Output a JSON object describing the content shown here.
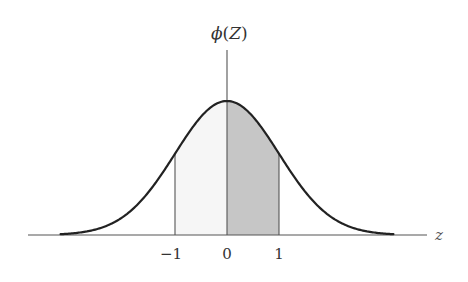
{
  "figure": {
    "y_axis_label_fn": "ϕ",
    "y_axis_label_open": "(",
    "y_axis_label_var": "Z",
    "y_axis_label_close": ")",
    "x_axis_label": "z",
    "ticks": [
      {
        "label": "−1",
        "value": -1
      },
      {
        "label": "0",
        "value": 0
      },
      {
        "label": "1",
        "value": 1
      }
    ],
    "colors": {
      "curve": "#222222",
      "axis": "#555555",
      "shade_dark": "#c6c6c6",
      "shade_light": "#f6f6f6",
      "background": "#ffffff"
    }
  },
  "chart_data": {
    "type": "area",
    "title": "",
    "xlabel": "z",
    "ylabel": "ϕ(Z)",
    "function": "standard_normal_pdf",
    "mean": 0,
    "sd": 1,
    "xlim": [
      -3.8,
      3.8
    ],
    "curve_range": [
      -3.2,
      3.2
    ],
    "ylim": [
      0,
      0.4
    ],
    "x_ticks": [
      -1,
      0,
      1
    ],
    "x_tick_labels": [
      "−1",
      "0",
      "1"
    ],
    "grid": false,
    "legend": null,
    "shaded_regions": [
      {
        "from": -1,
        "to": 0,
        "shade": "light"
      },
      {
        "from": 0,
        "to": 1,
        "shade": "dark"
      }
    ],
    "vertical_lines": [
      -1,
      0,
      1
    ],
    "points": {
      "x": [
        -3,
        -2,
        -1,
        0,
        1,
        2,
        3
      ],
      "y": [
        0.0044,
        0.054,
        0.242,
        0.399,
        0.242,
        0.054,
        0.0044
      ]
    }
  }
}
